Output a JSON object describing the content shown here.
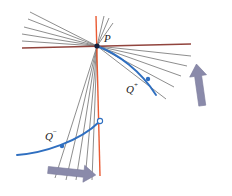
{
  "figure": {
    "title": "",
    "background_color": "#ffffff",
    "width": 232,
    "height": 196,
    "colors": {
      "axis_red": "#e8491d",
      "axis_dark_red": "#8c3a33",
      "pencil_gray": "#7a7a7a",
      "curve_blue": "#2f6fc0",
      "point_dark": "#14203c",
      "arrow_purple": "#8a8aaa",
      "label_black": "#1a1a1a"
    },
    "labels": {
      "p": "P",
      "q_plus_base": "Q",
      "q_plus_sup": "+",
      "q_minus_base": "Q",
      "q_minus_sup": "−"
    },
    "points": [
      {
        "name": "P",
        "x": 97,
        "y": 46,
        "style": "filled",
        "label": "P",
        "label_x": 104,
        "label_y": 41
      },
      {
        "name": "Q+",
        "x": 148,
        "y": 79,
        "style": "filled",
        "label": "Q",
        "sup": "+",
        "label_x": 128,
        "label_y": 92
      },
      {
        "name": "Q-",
        "x": 62,
        "y": 146,
        "style": "filled",
        "label": "Q",
        "sup": "−",
        "label_x": 47,
        "label_y": 139
      },
      {
        "name": "limit-point",
        "x": 100,
        "y": 122,
        "style": "hollow",
        "label": "",
        "label_x": 0,
        "label_y": 0
      }
    ],
    "lines": {
      "red_horizontal": {
        "x1": 22,
        "y1": 48,
        "x2": 191,
        "y2": 44
      },
      "red_vertical": {
        "x1": 96,
        "y1": 16,
        "x2": 100,
        "y2": 176
      },
      "pencil_upper_left": [
        {
          "x1": 97,
          "y1": 46,
          "x2": 30,
          "y2": 12
        },
        {
          "x1": 97,
          "y1": 46,
          "x2": 28,
          "y2": 19
        },
        {
          "x1": 97,
          "y1": 46,
          "x2": 24,
          "y2": 27
        },
        {
          "x1": 97,
          "y1": 46,
          "x2": 22,
          "y2": 34
        },
        {
          "x1": 97,
          "y1": 46,
          "x2": 22,
          "y2": 41
        }
      ],
      "pencil_lower_right": [
        {
          "x1": 97,
          "y1": 46,
          "x2": 190,
          "y2": 56
        },
        {
          "x1": 97,
          "y1": 46,
          "x2": 186,
          "y2": 66
        },
        {
          "x1": 97,
          "y1": 46,
          "x2": 180,
          "y2": 76
        },
        {
          "x1": 97,
          "y1": 46,
          "x2": 173,
          "y2": 87
        },
        {
          "x1": 97,
          "y1": 46,
          "x2": 166,
          "y2": 99
        }
      ],
      "pencil_lower_left": [
        {
          "x1": 97,
          "y1": 46,
          "x2": 55,
          "y2": 176
        },
        {
          "x1": 97,
          "y1": 46,
          "x2": 66,
          "y2": 178
        },
        {
          "x1": 97,
          "y1": 46,
          "x2": 76,
          "y2": 178
        },
        {
          "x1": 97,
          "y1": 46,
          "x2": 85,
          "y2": 178
        },
        {
          "x1": 97,
          "y1": 46,
          "x2": 92,
          "y2": 178
        }
      ],
      "pencil_upper_right": [
        {
          "x1": 97,
          "y1": 46,
          "x2": 104,
          "y2": 16
        },
        {
          "x1": 97,
          "y1": 46,
          "x2": 108,
          "y2": 18
        },
        {
          "x1": 97,
          "y1": 46,
          "x2": 112,
          "y2": 22
        }
      ]
    },
    "curves": {
      "upper_arc": {
        "d": "M 97 46 C 118 54 140 70 155 94",
        "note": "blue arc from P through Q+"
      },
      "lower_arc": {
        "d": "M 18 154 C 45 152 80 140 100 122",
        "note": "blue arc through Q- to hollow limit point"
      }
    },
    "arrows": [
      {
        "name": "arrow-up-right",
        "direction": "up",
        "x": 197,
        "y": 68,
        "length": 42,
        "rotation": -8
      },
      {
        "name": "arrow-right-bottom",
        "direction": "right",
        "x": 48,
        "y": 170,
        "length": 52,
        "rotation": 6
      }
    ]
  }
}
